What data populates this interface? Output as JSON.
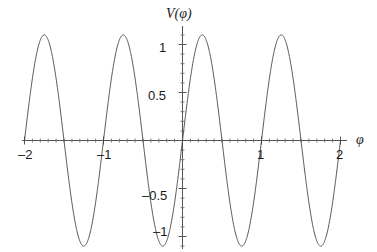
{
  "figure": {
    "title": "V(φ)",
    "xaxis_title": "φ",
    "line_color": "#444444",
    "axis_color": "#555555",
    "background": "#ffffff"
  },
  "labels": {
    "x": {
      "minus_two": "–2",
      "minus_one": "–1",
      "plus_one": "1",
      "plus_two": "2"
    },
    "y": {
      "one": "1",
      "half": "0.5",
      "minus_half": "–0.5",
      "minus_one": "–1"
    }
  },
  "chart_data": {
    "type": "line",
    "title": "V(φ)",
    "xlabel": "φ",
    "ylabel": "V(φ)",
    "xlim": [
      -2.05,
      2.05
    ],
    "ylim": [
      -1.2,
      1.2
    ],
    "xticks": [
      -2,
      -1,
      1,
      2
    ],
    "xtick_labels": [
      "–2",
      "–1",
      "1",
      "2"
    ],
    "yticks": [
      -1,
      -0.5,
      0.5,
      1
    ],
    "ytick_labels": [
      "–1",
      "–0.5",
      "0.5",
      "1"
    ],
    "minor_ticks": true,
    "grid": false,
    "legend": false,
    "amplitude": 1.1,
    "period": 1.0,
    "function": "1.1*sin(2*pi*phi)",
    "zero_crossings": [
      -2.0,
      -1.5,
      -1.0,
      -0.5,
      0.0,
      0.5,
      1.0,
      1.5,
      2.0
    ],
    "peaks": {
      "x": [
        -1.75,
        -0.75,
        0.25,
        1.25
      ],
      "y": [
        1.1,
        1.1,
        1.1,
        1.1
      ]
    },
    "troughs": {
      "x": [
        -1.25,
        -0.25,
        0.75,
        1.75
      ],
      "y": [
        -1.1,
        -1.1,
        -1.1,
        -1.1
      ]
    },
    "series": [
      {
        "name": "V(φ)",
        "x": [
          -2.0,
          -1.95,
          -1.9,
          -1.85,
          -1.8,
          -1.75,
          -1.7,
          -1.65,
          -1.6,
          -1.55,
          -1.5,
          -1.45,
          -1.4,
          -1.35,
          -1.3,
          -1.25,
          -1.2,
          -1.15,
          -1.1,
          -1.05,
          -1.0,
          -0.95,
          -0.9,
          -0.85,
          -0.8,
          -0.75,
          -0.7,
          -0.65,
          -0.6,
          -0.55,
          -0.5,
          -0.45,
          -0.4,
          -0.35,
          -0.3,
          -0.25,
          -0.2,
          -0.15,
          -0.1,
          -0.05,
          0.0,
          0.05,
          0.1,
          0.15,
          0.2,
          0.25,
          0.3,
          0.35,
          0.4,
          0.45,
          0.5,
          0.55,
          0.6,
          0.65,
          0.7,
          0.75,
          0.8,
          0.85,
          0.9,
          0.95,
          1.0,
          1.05,
          1.1,
          1.15,
          1.2,
          1.25,
          1.3,
          1.35,
          1.4,
          1.45,
          1.5,
          1.55,
          1.6,
          1.65,
          1.7,
          1.75,
          1.8,
          1.85,
          1.9,
          1.95,
          2.0
        ],
        "y": [
          0.0,
          0.34,
          0.65,
          0.89,
          1.05,
          1.1,
          1.05,
          0.89,
          0.65,
          0.34,
          0.0,
          -0.34,
          -0.65,
          -0.89,
          -1.05,
          -1.1,
          -1.05,
          -0.89,
          -0.65,
          -0.34,
          0.0,
          0.34,
          0.65,
          0.89,
          1.05,
          1.1,
          1.05,
          0.89,
          0.65,
          0.34,
          0.0,
          -0.34,
          -0.65,
          -0.89,
          -1.05,
          -1.1,
          -1.05,
          -0.89,
          -0.65,
          -0.34,
          0.0,
          0.34,
          0.65,
          0.89,
          1.05,
          1.1,
          1.05,
          0.89,
          0.65,
          0.34,
          0.0,
          -0.34,
          -0.65,
          -0.89,
          -1.05,
          -1.1,
          -1.05,
          -0.89,
          -0.65,
          -0.34,
          0.0,
          0.34,
          0.65,
          0.89,
          1.05,
          1.1,
          1.05,
          0.89,
          0.65,
          0.34,
          0.0,
          -0.34,
          -0.65,
          -0.89,
          -1.05,
          -1.1,
          -1.05,
          -0.89,
          -0.65,
          -0.34,
          0.0
        ]
      }
    ]
  }
}
